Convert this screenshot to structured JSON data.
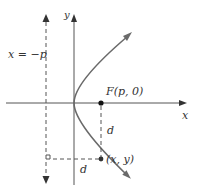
{
  "diagram": {
    "labels": {
      "y_axis": "y",
      "x_axis": "x",
      "directrix": "x = −p",
      "focus": "F(p, 0)",
      "point": "(x, y)",
      "distance_to_focus": "d",
      "distance_to_directrix": "d"
    },
    "colors": {
      "axis": "#555555",
      "curve": "#6a6a6a",
      "dashed": "#555555",
      "text": "#333333"
    }
  }
}
